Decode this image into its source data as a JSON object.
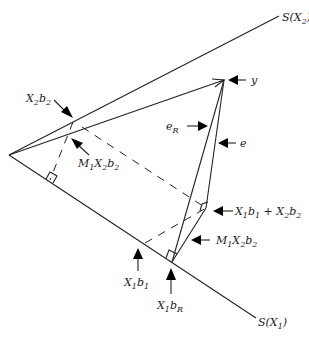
{
  "diagram": {
    "subspaces": [
      {
        "id": "SX2",
        "label": "S(X",
        "sub": "2",
        "close": ")"
      },
      {
        "id": "SX1",
        "label": "S(X",
        "sub": "1",
        "close": ")"
      }
    ],
    "labels": {
      "y": "y",
      "e": "e",
      "eR": {
        "base": "e",
        "sub": "R"
      },
      "X2b2": {
        "parts": [
          "X",
          "2",
          "b",
          "2"
        ]
      },
      "M1X2b2_top": {
        "parts": [
          "M",
          "1",
          "X",
          "2",
          "b",
          "2"
        ]
      },
      "M1X2b2_right": {
        "parts": [
          "M",
          "1",
          "X",
          "2",
          "b",
          "2"
        ]
      },
      "X1b1_plus_X2b2": {
        "parts": [
          "X",
          "1",
          "b",
          "1",
          " + ",
          "X",
          "2",
          "b",
          "2"
        ]
      },
      "X1b1": {
        "parts": [
          "X",
          "1",
          "b",
          "1"
        ]
      },
      "X1bR": {
        "parts": [
          "X",
          "1",
          "b",
          "R"
        ]
      }
    },
    "points": {
      "origin": [
        9,
        155
      ],
      "y": [
        224,
        80
      ],
      "X2b2": [
        73,
        122
      ],
      "M1X2b2_on_y": [
        64,
        134
      ],
      "X1b1": [
        145,
        243
      ],
      "X1bR": [
        172,
        262
      ],
      "fitted": [
        206,
        208
      ]
    }
  }
}
